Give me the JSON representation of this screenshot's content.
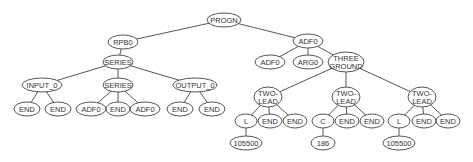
{
  "diagram": {
    "type": "tree",
    "nodes": [
      {
        "id": "n0",
        "label": [
          "PROGN"
        ],
        "x": 224,
        "y": 20,
        "rx": 17,
        "ry": 7
      },
      {
        "id": "n1",
        "label": [
          "RPB0"
        ],
        "x": 123,
        "y": 42,
        "rx": 15,
        "ry": 7
      },
      {
        "id": "n2",
        "label": [
          "SERIES"
        ],
        "x": 118,
        "y": 62,
        "rx": 15,
        "ry": 7
      },
      {
        "id": "n3",
        "label": [
          "INPUT_0"
        ],
        "x": 42,
        "y": 85,
        "rx": 20,
        "ry": 7
      },
      {
        "id": "n4",
        "label": [
          "SERIES"
        ],
        "x": 118,
        "y": 85,
        "rx": 15,
        "ry": 7
      },
      {
        "id": "n5",
        "label": [
          "OUTPUT_0"
        ],
        "x": 195,
        "y": 85,
        "rx": 22,
        "ry": 7
      },
      {
        "id": "n6",
        "label": [
          "END"
        ],
        "x": 27,
        "y": 109,
        "rx": 13,
        "ry": 7
      },
      {
        "id": "n7",
        "label": [
          "END"
        ],
        "x": 58,
        "y": 109,
        "rx": 13,
        "ry": 7
      },
      {
        "id": "n8",
        "label": [
          "ADF0"
        ],
        "x": 91,
        "y": 109,
        "rx": 15,
        "ry": 7
      },
      {
        "id": "n9",
        "label": [
          "END"
        ],
        "x": 118,
        "y": 109,
        "rx": 12,
        "ry": 7
      },
      {
        "id": "n10",
        "label": [
          "ADF0"
        ],
        "x": 145,
        "y": 109,
        "rx": 15,
        "ry": 7
      },
      {
        "id": "n11",
        "label": [
          "END"
        ],
        "x": 180,
        "y": 109,
        "rx": 13,
        "ry": 7
      },
      {
        "id": "n12",
        "label": [
          "END"
        ],
        "x": 212,
        "y": 109,
        "rx": 13,
        "ry": 7
      },
      {
        "id": "n13",
        "label": [
          "ADF0"
        ],
        "x": 308,
        "y": 41,
        "rx": 15,
        "ry": 7
      },
      {
        "id": "n14",
        "label": [
          "ADF0"
        ],
        "x": 270,
        "y": 62,
        "rx": 15,
        "ry": 7
      },
      {
        "id": "n15",
        "label": [
          "ARG0"
        ],
        "x": 308,
        "y": 62,
        "rx": 15,
        "ry": 7
      },
      {
        "id": "n16",
        "label": [
          "THREE",
          "GROUND"
        ],
        "x": 346,
        "y": 62,
        "rx": 18,
        "ry": 10
      },
      {
        "id": "n17",
        "label": [
          "TWO-",
          "LEAD"
        ],
        "x": 268,
        "y": 97,
        "rx": 14,
        "ry": 10
      },
      {
        "id": "n18",
        "label": [
          "TWO-",
          "LEAD"
        ],
        "x": 346,
        "y": 97,
        "rx": 14,
        "ry": 10
      },
      {
        "id": "n19",
        "label": [
          "TWO-",
          "LEAD"
        ],
        "x": 422,
        "y": 97,
        "rx": 14,
        "ry": 10
      },
      {
        "id": "n20",
        "label": [
          "L"
        ],
        "x": 246,
        "y": 121,
        "rx": 11,
        "ry": 7
      },
      {
        "id": "n21",
        "label": [
          "END"
        ],
        "x": 270,
        "y": 121,
        "rx": 12,
        "ry": 7
      },
      {
        "id": "n22",
        "label": [
          "END"
        ],
        "x": 295,
        "y": 121,
        "rx": 12,
        "ry": 7
      },
      {
        "id": "n23",
        "label": [
          "C"
        ],
        "x": 323,
        "y": 121,
        "rx": 11,
        "ry": 7
      },
      {
        "id": "n24",
        "label": [
          "END"
        ],
        "x": 347,
        "y": 121,
        "rx": 12,
        "ry": 7
      },
      {
        "id": "n25",
        "label": [
          "END"
        ],
        "x": 372,
        "y": 121,
        "rx": 12,
        "ry": 7
      },
      {
        "id": "n26",
        "label": [
          "L"
        ],
        "x": 399,
        "y": 121,
        "rx": 11,
        "ry": 7
      },
      {
        "id": "n27",
        "label": [
          "END"
        ],
        "x": 424,
        "y": 121,
        "rx": 12,
        "ry": 7
      },
      {
        "id": "n28",
        "label": [
          "END"
        ],
        "x": 448,
        "y": 121,
        "rx": 12,
        "ry": 7
      },
      {
        "id": "n29",
        "label": [
          "105500"
        ],
        "x": 246,
        "y": 143,
        "rx": 16,
        "ry": 7
      },
      {
        "id": "n30",
        "label": [
          "186"
        ],
        "x": 323,
        "y": 143,
        "rx": 12,
        "ry": 7
      },
      {
        "id": "n31",
        "label": [
          "105500"
        ],
        "x": 399,
        "y": 143,
        "rx": 16,
        "ry": 7
      }
    ],
    "edges": [
      [
        "n0",
        "n1"
      ],
      [
        "n0",
        "n13"
      ],
      [
        "n1",
        "n2"
      ],
      [
        "n2",
        "n3"
      ],
      [
        "n2",
        "n4"
      ],
      [
        "n2",
        "n5"
      ],
      [
        "n3",
        "n6"
      ],
      [
        "n3",
        "n7"
      ],
      [
        "n4",
        "n8"
      ],
      [
        "n4",
        "n9"
      ],
      [
        "n4",
        "n10"
      ],
      [
        "n5",
        "n11"
      ],
      [
        "n5",
        "n12"
      ],
      [
        "n13",
        "n14"
      ],
      [
        "n13",
        "n15"
      ],
      [
        "n13",
        "n16"
      ],
      [
        "n16",
        "n17"
      ],
      [
        "n16",
        "n18"
      ],
      [
        "n16",
        "n19"
      ],
      [
        "n17",
        "n20"
      ],
      [
        "n17",
        "n21"
      ],
      [
        "n17",
        "n22"
      ],
      [
        "n18",
        "n23"
      ],
      [
        "n18",
        "n24"
      ],
      [
        "n18",
        "n25"
      ],
      [
        "n19",
        "n26"
      ],
      [
        "n19",
        "n27"
      ],
      [
        "n19",
        "n28"
      ],
      [
        "n20",
        "n29"
      ],
      [
        "n23",
        "n30"
      ],
      [
        "n26",
        "n31"
      ]
    ]
  }
}
